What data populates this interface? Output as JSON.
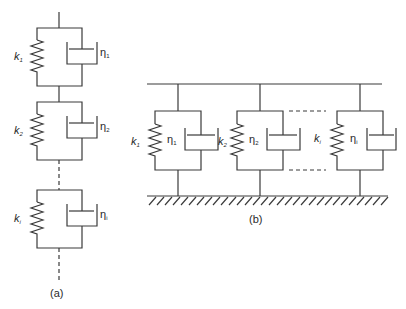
{
  "figure": {
    "panel_a": {
      "caption": "(a)",
      "description": "Kelvin-Voigt elements connected in series",
      "units": [
        {
          "spring_label": "k",
          "spring_sub": "1",
          "dashpot_label": "η",
          "dashpot_sub": "1"
        },
        {
          "spring_label": "k",
          "spring_sub": "2",
          "dashpot_label": "η",
          "dashpot_sub": "2"
        },
        {
          "spring_label": "k",
          "spring_sub": "i",
          "dashpot_label": "η",
          "dashpot_sub": "i"
        }
      ]
    },
    "panel_b": {
      "caption": "(b)",
      "description": "Kelvin-Voigt elements connected in parallel between a rigid bar and fixed ground",
      "units": [
        {
          "spring_label": "k",
          "spring_sub": "1",
          "dashpot_label": "η",
          "dashpot_sub": "1"
        },
        {
          "spring_label": "k",
          "spring_sub": "2",
          "dashpot_label": "η",
          "dashpot_sub": "2"
        },
        {
          "spring_label": "k",
          "spring_sub": "i",
          "dashpot_label": "η",
          "dashpot_sub": "i"
        }
      ]
    }
  }
}
